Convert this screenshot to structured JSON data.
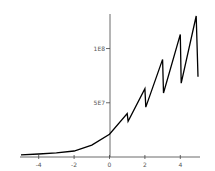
{
  "chart_data": {
    "type": "line",
    "title": "",
    "xlabel": "",
    "ylabel": "",
    "xlim": [
      -5,
      5
    ],
    "ylim": [
      0,
      130000000
    ],
    "grid": false,
    "legend": null,
    "x_ticks": [
      -4,
      -2,
      0,
      2,
      4
    ],
    "x_tick_labels": [
      "-4",
      "-2",
      "0",
      "2",
      "4"
    ],
    "y_ticks": [
      50000000,
      100000000
    ],
    "y_tick_labels": [
      "5E7",
      "1E8"
    ],
    "series": [
      {
        "name": "series-1",
        "color": "#000000",
        "x": [
          -5,
          -4,
          -3,
          -2,
          -1,
          0,
          1,
          1.05,
          2,
          2.05,
          3,
          3.05,
          4,
          4.05,
          4.9,
          5
        ],
        "y": [
          2000000,
          2800000,
          3800000,
          5500000,
          11000000,
          21000000,
          40000000,
          33000000,
          63000000,
          46000000,
          90000000,
          59000000,
          113000000,
          68000000,
          130000000,
          74000000
        ]
      }
    ]
  }
}
